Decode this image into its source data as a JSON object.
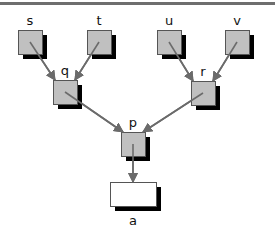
{
  "diagram": {
    "type": "tree",
    "colors": {
      "node_fill": "#c0c0c0",
      "leaf_fill": "#ffffff",
      "shadow": "#000000",
      "edge": "#6b6b6b",
      "border": "#555555",
      "top_rule": "#6e6e6e"
    },
    "nodes": [
      {
        "id": "s",
        "label": "s",
        "x": 18,
        "y": 30,
        "w": 24,
        "h": 24,
        "fill": "#c0c0c0"
      },
      {
        "id": "t",
        "label": "t",
        "x": 87,
        "y": 30,
        "w": 24,
        "h": 24,
        "fill": "#c0c0c0"
      },
      {
        "id": "u",
        "label": "u",
        "x": 157,
        "y": 30,
        "w": 24,
        "h": 24,
        "fill": "#c0c0c0"
      },
      {
        "id": "v",
        "label": "v",
        "x": 225,
        "y": 30,
        "w": 24,
        "h": 24,
        "fill": "#c0c0c0"
      },
      {
        "id": "q",
        "label": "q",
        "x": 53,
        "y": 80,
        "w": 24,
        "h": 24,
        "fill": "#c0c0c0"
      },
      {
        "id": "r",
        "label": "r",
        "x": 191,
        "y": 81,
        "w": 24,
        "h": 24,
        "fill": "#c0c0c0"
      },
      {
        "id": "p",
        "label": "p",
        "x": 121,
        "y": 132,
        "w": 24,
        "h": 24,
        "fill": "#c0c0c0"
      },
      {
        "id": "a",
        "label": "a",
        "x": 110,
        "y": 182,
        "w": 46,
        "h": 24,
        "fill": "#ffffff"
      }
    ],
    "edges": [
      {
        "from": "s",
        "to": "q"
      },
      {
        "from": "t",
        "to": "q"
      },
      {
        "from": "u",
        "to": "r"
      },
      {
        "from": "v",
        "to": "r"
      },
      {
        "from": "q",
        "to": "p"
      },
      {
        "from": "r",
        "to": "p"
      },
      {
        "from": "p",
        "to": "a"
      }
    ]
  }
}
